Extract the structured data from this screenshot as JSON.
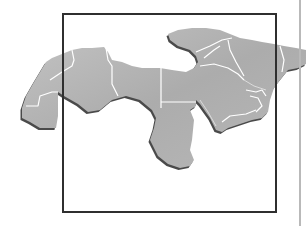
{
  "figure": {
    "type": "map",
    "style": "grayscale watercolor countries with white borders and drop shadow",
    "colors": {
      "background": "#ffffff",
      "land_fill": "#b0b0b0",
      "land_fill_light": "#c6c6c6",
      "border": "#ffffff",
      "shadow": "#4a4a4a",
      "frame": "#2f2f2f",
      "side_rule": "#b9b9b9"
    },
    "frame": {
      "x": 62,
      "y": 13,
      "width": 213,
      "height": 198
    },
    "side_rule": {
      "x": 299
    },
    "regions": [
      "Western Sahara / Mauritania",
      "Morocco",
      "Algeria",
      "Tunisia",
      "Libya",
      "Egypt",
      "Sudan",
      "Turkey",
      "Syria / Levant",
      "Iraq",
      "Iran",
      "Afghanistan",
      "Saudi Arabia",
      "Gulf states",
      "Yemen",
      "Oman"
    ]
  }
}
